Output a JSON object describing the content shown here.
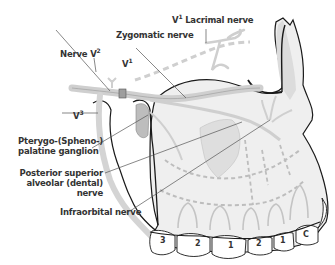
{
  "figure": {
    "labels": {
      "v1_lacrimal": {
        "prefix": "V",
        "sup": "1",
        "text": " Lacrimal nerve"
      },
      "zygomatic": "Zygomatic nerve",
      "nerve_v2": {
        "prefix": "Nerve V",
        "sup": "2"
      },
      "v1": {
        "prefix": "V",
        "sup": "1"
      },
      "v3": {
        "prefix": "V",
        "sup": "3"
      },
      "pterygopalatine_line1": "Pterygo-(Spheno-)",
      "pterygopalatine_line2": "palatine ganglion",
      "psa_line1": "Posterior superior",
      "psa_line2": "alveolar (dental)",
      "psa_line3": "nerve",
      "infraorbital": "Infraorbital nerve"
    },
    "teeth": [
      "3",
      "2",
      "1",
      "2",
      "1",
      "C"
    ],
    "colors": {
      "bone_fill": "#ececec",
      "nerve_fill": "#cfcfcf",
      "outline": "#1a1a1a",
      "leader": "#555555",
      "text": "#333333"
    }
  }
}
